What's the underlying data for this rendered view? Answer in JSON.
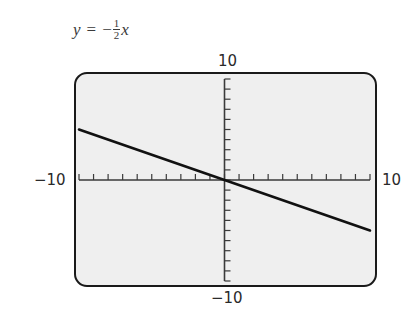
{
  "equation": {
    "lhs": "y",
    "equals": "=",
    "sign": "−",
    "numerator": "1",
    "denominator": "2",
    "variable": "x"
  },
  "axis_labels": {
    "x_min": "−10",
    "x_max": "10",
    "y_min": "−10",
    "y_max": "10"
  },
  "colors": {
    "screen_fill": "#efefef",
    "frame": "#1a1a1a",
    "line": "#111111",
    "axis": "#3a3a3a"
  },
  "chart_data": {
    "type": "line",
    "xlabel": "",
    "ylabel": "",
    "xlim": [
      -10,
      10
    ],
    "ylim": [
      -10,
      10
    ],
    "x_tick_step": 1,
    "y_tick_step": 1,
    "grid": false,
    "legend": null,
    "series": [
      {
        "name": "y = -1/2 x",
        "x": [
          -10,
          -5,
          0,
          5,
          10
        ],
        "y": [
          5,
          2.5,
          0,
          -2.5,
          -5
        ]
      }
    ],
    "annotations": [
      "-10",
      "10",
      "-10",
      "10"
    ]
  }
}
